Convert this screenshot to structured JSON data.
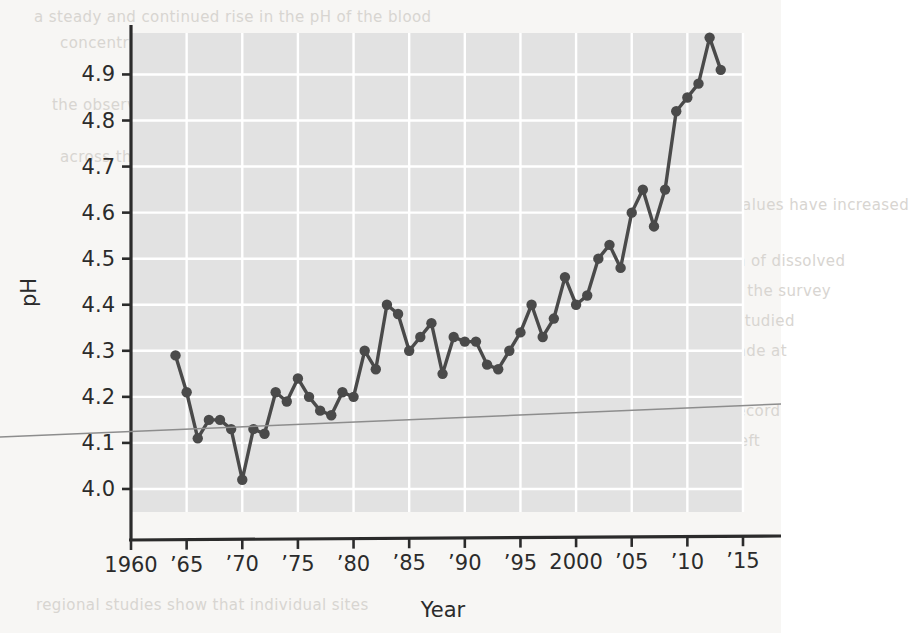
{
  "figure": {
    "background_color": "#f7f6f4",
    "plot_background_color": "#e2e2e2",
    "grid_color": "#ffffff",
    "axis_color": "#2b2b2b",
    "series_color": "#4a4a4a",
    "artifact_line_color": "#8d8d8d"
  },
  "ghost_page_text": [
    {
      "text": "a steady and continued rise in the pH of the blood",
      "x": 34,
      "y": 8
    },
    {
      "text": "concentration over five decades of measurement",
      "x": 60,
      "y": 34
    },
    {
      "text": "the observed trend is consistent with a broad shift",
      "x": 52,
      "y": 96
    },
    {
      "text": "across the sampled population of adults",
      "x": 60,
      "y": 148
    },
    {
      "text": "in which the measured values have increased",
      "x": 548,
      "y": 196
    },
    {
      "text": "across the decades",
      "x": 556,
      "y": 222
    },
    {
      "text": "rise in the concentration of dissolved",
      "x": 552,
      "y": 252
    },
    {
      "text": "compounds recorded by the survey",
      "x": 552,
      "y": 282
    },
    {
      "text": "teams over the period studied",
      "x": 556,
      "y": 312
    },
    {
      "text": "measurements were made at",
      "x": 556,
      "y": 342
    },
    {
      "text": "regular yearly intervals",
      "x": 556,
      "y": 372
    },
    {
      "text": "and compiled into the record",
      "x": 552,
      "y": 402
    },
    {
      "text": "shown in the figure at left",
      "x": 556,
      "y": 432
    },
    {
      "text": "regional studies show that individual sites",
      "x": 36,
      "y": 596
    }
  ],
  "chart_data": {
    "type": "line",
    "title": "",
    "xlabel": "Year",
    "ylabel": "pH",
    "xlim": [
      1960,
      2015
    ],
    "ylim": [
      3.95,
      4.99
    ],
    "grid": true,
    "legend": null,
    "xticks": [
      1960,
      1965,
      1970,
      1975,
      1980,
      1985,
      1990,
      1995,
      2000,
      2005,
      2010,
      2015
    ],
    "xtick_labels": [
      "1960",
      "’65",
      "’70",
      "’75",
      "’80",
      "’85",
      "’90",
      "’95",
      "2000",
      "’05",
      "’10",
      "’15"
    ],
    "yticks": [
      4.0,
      4.1,
      4.2,
      4.3,
      4.4,
      4.5,
      4.6,
      4.7,
      4.8,
      4.9
    ],
    "ytick_labels": [
      "4.0",
      "4.1",
      "4.2",
      "4.3",
      "4.4",
      "4.5",
      "4.6",
      "4.7",
      "4.8",
      "4.9"
    ],
    "marker": "circle",
    "series": [
      {
        "name": "pH",
        "x": [
          1964,
          1965,
          1966,
          1967,
          1968,
          1969,
          1970,
          1971,
          1972,
          1973,
          1974,
          1975,
          1976,
          1977,
          1978,
          1979,
          1980,
          1981,
          1982,
          1983,
          1984,
          1985,
          1986,
          1987,
          1988,
          1989,
          1990,
          1991,
          1992,
          1993,
          1994,
          1995,
          1996,
          1997,
          1998,
          1999,
          2000,
          2001,
          2002,
          2003,
          2004,
          2005,
          2006,
          2007,
          2008,
          2009,
          2010,
          2011,
          2012,
          2013
        ],
        "values": [
          4.29,
          4.21,
          4.11,
          4.15,
          4.15,
          4.13,
          4.02,
          4.13,
          4.12,
          4.21,
          4.19,
          4.24,
          4.2,
          4.17,
          4.16,
          4.21,
          4.2,
          4.3,
          4.26,
          4.4,
          4.38,
          4.3,
          4.33,
          4.36,
          4.25,
          4.33,
          4.32,
          4.32,
          4.27,
          4.26,
          4.3,
          4.34,
          4.4,
          4.33,
          4.37,
          4.46,
          4.4,
          4.42,
          4.5,
          4.53,
          4.48,
          4.6,
          4.65,
          4.57,
          4.65,
          4.82,
          4.85,
          4.88,
          4.98,
          4.91
        ]
      }
    ]
  }
}
